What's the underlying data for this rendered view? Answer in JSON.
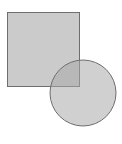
{
  "diagram": {
    "shapes": [
      {
        "type": "square",
        "x": 7,
        "y": 12,
        "width": 72,
        "height": 74,
        "fill": "#cbcbcb",
        "stroke": "#6e6e6e"
      },
      {
        "type": "circle",
        "cx": 83,
        "cy": 93,
        "r": 33,
        "fill": "#b4b4b4",
        "fill_opacity": 0.55,
        "stroke": "#6e6e6e"
      }
    ],
    "overlap_fill": "#9d9d9d"
  }
}
